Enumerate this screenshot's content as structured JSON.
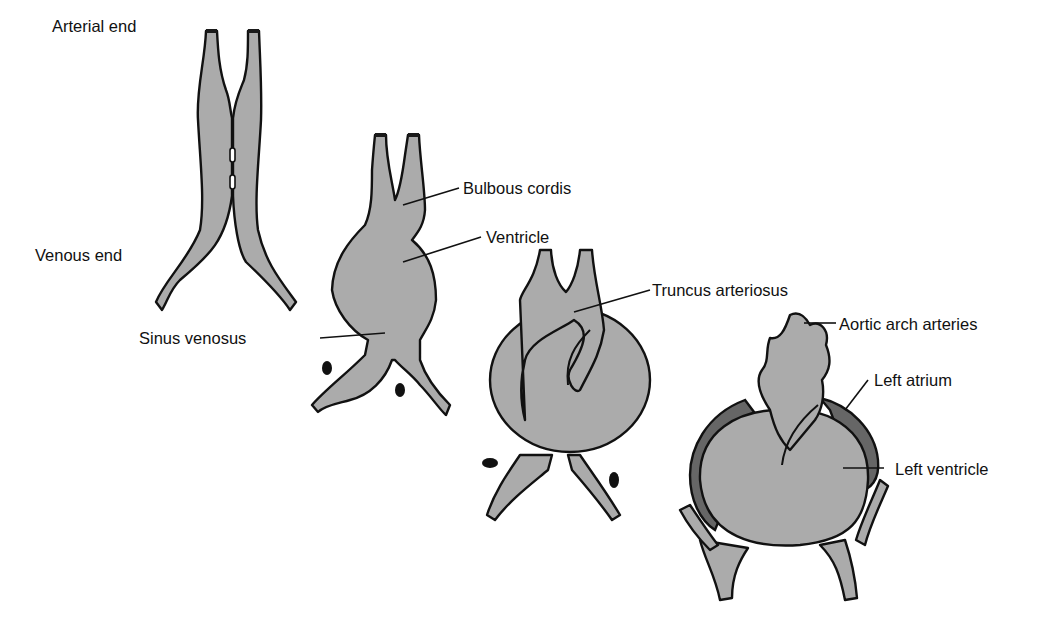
{
  "figure": {
    "fill_color": "#ababab",
    "atrium_color": "#666666",
    "stroke_color": "#111111"
  },
  "labels": {
    "arterial_end": "Arterial end",
    "venous_end": "Venous end",
    "sinus_venosus": "Sinus venosus",
    "bulbous_cordis": "Bulbous cordis",
    "ventricle": "Ventricle",
    "truncus_arteriosus": "Truncus arteriosus",
    "aortic_arch_arteries": "Aortic arch arteries",
    "left_atrium": "Left atrium",
    "left_ventricle": "Left ventricle"
  },
  "stages": [
    {
      "id": 1,
      "name": "paired heart tubes fusing"
    },
    {
      "id": 2,
      "name": "single tube with bulbous cordis, ventricle, sinus venosus"
    },
    {
      "id": 3,
      "name": "looping heart with truncus arteriosus"
    },
    {
      "id": 4,
      "name": "looped heart with aortic arches, left atrium, left ventricle"
    }
  ]
}
